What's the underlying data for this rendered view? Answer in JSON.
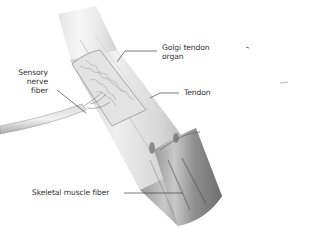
{
  "figure": {
    "type": "anatomical-illustration"
  },
  "labels": {
    "golgi_line1": "Golgi tendon",
    "golgi_line2": "organ",
    "tendon": "Tendon",
    "sensory_line1": "Sensory",
    "sensory_line2": "nerve",
    "sensory_line3": "fiber",
    "skeletal": "Skeletal muscle fiber"
  },
  "colors": {
    "background": "#ffffff",
    "text": "#333333",
    "leader_line": "#444444",
    "tendon_light": "#e6e6e6",
    "tendon_mid": "#bdbdbd",
    "muscle_dark": "#7a7a7a"
  }
}
